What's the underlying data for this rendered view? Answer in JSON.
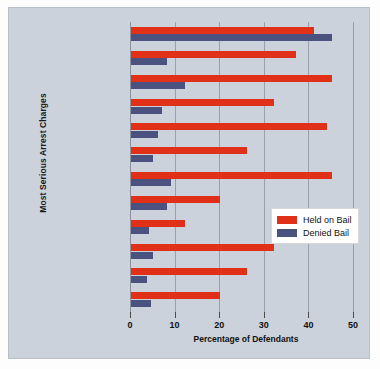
{
  "chart_data": {
    "type": "bar",
    "orientation": "horizontal",
    "title": "",
    "xlabel": "Percentage of Defendants",
    "ylabel": "Most Serious Arrest Charges",
    "xlim": [
      0,
      52
    ],
    "xticks": [
      0,
      10,
      20,
      30,
      40,
      50
    ],
    "grid": true,
    "legend_position": "center-right",
    "categories": [
      "Murder",
      "Rape",
      "Robbery",
      "Assault",
      "Burglary",
      "Larceny/theft",
      "Motor vehicle theft",
      "Forgery",
      "Fraud",
      "Drug trafficking",
      "Weapons",
      "Driving related"
    ],
    "series": [
      {
        "name": "Held on Bail",
        "color": "#e03018",
        "values": [
          41,
          37,
          45,
          32,
          44,
          26,
          45,
          20,
          12,
          32,
          26,
          20
        ]
      },
      {
        "name": "Denied Bail",
        "color": "#4c5280",
        "values": [
          45,
          8,
          12,
          7,
          6,
          5,
          9,
          8,
          4,
          5,
          3.5,
          4.5
        ]
      }
    ]
  },
  "legend": {
    "items": [
      {
        "label": "Held on Bail",
        "color": "#e03018"
      },
      {
        "label": "Denied Bail",
        "color": "#4c5280"
      }
    ]
  }
}
